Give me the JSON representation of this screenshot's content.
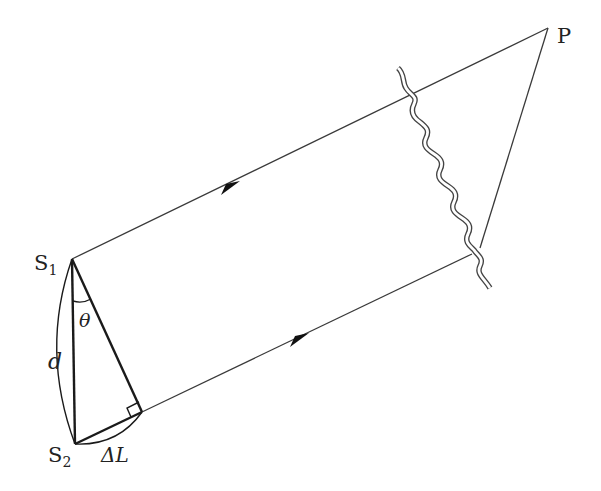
{
  "diagram": {
    "colors": {
      "line": "#3a3a3a",
      "thick": "#1a1a1a",
      "background": "#ffffff"
    },
    "labels": {
      "source1": "S",
      "source1_sub": "1",
      "source2": "S",
      "source2_sub": "2",
      "point": "P",
      "separation": "d",
      "angle": "θ",
      "path_difference": "ΔL"
    },
    "points": {
      "S1": [
        72,
        259
      ],
      "S2": [
        75,
        444
      ],
      "foot": [
        142,
        412
      ],
      "P": [
        548,
        28
      ],
      "upper_ray_break": [
        412,
        93
      ],
      "lower_ray_break": [
        472,
        254
      ],
      "P_line_break": [
        480,
        248
      ]
    },
    "arrows": [
      {
        "name": "upper-ray-arrow",
        "at": [
          232,
          185
        ]
      },
      {
        "name": "lower-ray-arrow",
        "at": [
          300,
          337
        ]
      }
    ]
  }
}
